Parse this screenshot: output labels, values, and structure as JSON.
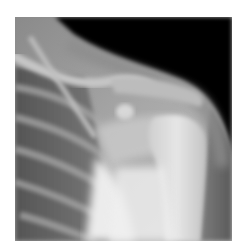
{
  "image": {
    "subject": "shoulder-radiograph",
    "view": "frontal",
    "colors": {
      "background": "#ffffff",
      "soft_tissue_dark": "#050505",
      "lung_field": "#5a5a5a",
      "bone": "#e8e8e8",
      "arrow_fill": "#ffffff"
    }
  },
  "annotations": [
    {
      "type": "arrow",
      "style": "outlined",
      "direction": "right",
      "color": "#ffffff"
    },
    {
      "type": "arrow",
      "style": "solid",
      "direction": "left",
      "color": "#ffffff"
    }
  ]
}
